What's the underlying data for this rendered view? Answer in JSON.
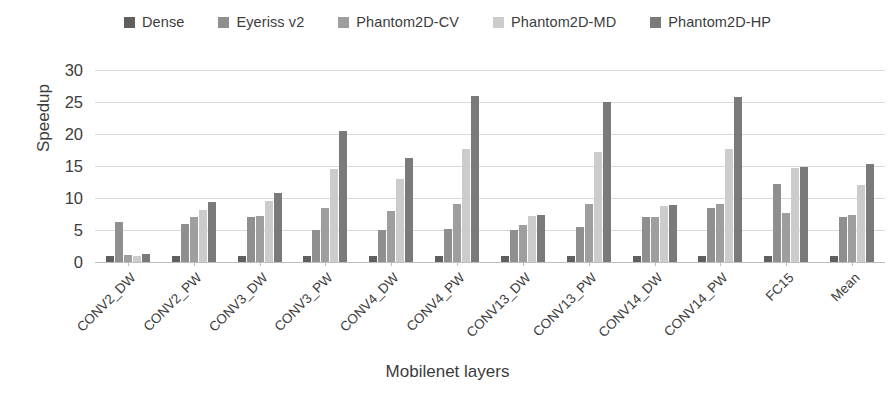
{
  "chart_data": {
    "type": "bar",
    "title": "",
    "xlabel": "Mobilenet layers",
    "ylabel": "Speedup",
    "ylim": [
      0,
      30
    ],
    "yticks": [
      0,
      5,
      10,
      15,
      20,
      25,
      30
    ],
    "ytick_labels": [
      "0",
      "5",
      "10",
      "15",
      "20",
      "25",
      "30"
    ],
    "grid": true,
    "legend_position": "top-center",
    "categories": [
      "CONV2_DW",
      "CONV2_PW",
      "CONV3_DW",
      "CONV3_PW",
      "CONV4_DW",
      "CONV4_PW",
      "CONV13_DW",
      "CONV13_PW",
      "CONV14_DW",
      "CONV14_PW",
      "FC15",
      "Mean"
    ],
    "series": [
      {
        "name": "Dense",
        "color": "#5f5f5f",
        "values": [
          1.0,
          1.0,
          1.0,
          1.0,
          1.0,
          1.0,
          1.0,
          1.0,
          1.0,
          1.0,
          1.0,
          1.0
        ]
      },
      {
        "name": "Eyeriss v2",
        "color": "#8f8f8f",
        "values": [
          6.3,
          6.0,
          7.0,
          5.0,
          5.0,
          5.1,
          5.0,
          5.5,
          7.1,
          8.5,
          12.2,
          7.0
        ]
      },
      {
        "name": "Phantom2D-CV",
        "color": "#9e9e9e",
        "values": [
          1.1,
          7.0,
          7.2,
          8.4,
          8.0,
          9.1,
          5.8,
          9.0,
          7.0,
          9.1,
          7.6,
          7.3
        ]
      },
      {
        "name": "Phantom2D-MD",
        "color": "#cccccc",
        "values": [
          1.0,
          8.2,
          9.5,
          14.5,
          13.0,
          17.7,
          7.2,
          17.2,
          8.8,
          17.7,
          14.7,
          12.0
        ]
      },
      {
        "name": "Phantom2D-HP",
        "color": "#7a7a7a",
        "values": [
          1.2,
          9.4,
          10.8,
          20.4,
          16.3,
          26.0,
          7.3,
          25.0,
          8.9,
          25.8,
          14.9,
          15.3
        ]
      }
    ]
  },
  "legend": {
    "items": [
      {
        "label": "Dense",
        "color": "#5f5f5f"
      },
      {
        "label": "Eyeriss v2",
        "color": "#8f8f8f"
      },
      {
        "label": "Phantom2D-CV",
        "color": "#9e9e9e"
      },
      {
        "label": "Phantom2D-MD",
        "color": "#cccccc"
      },
      {
        "label": "Phantom2D-HP",
        "color": "#7a7a7a"
      }
    ]
  },
  "axes": {
    "y_title": "Speedup",
    "x_title": "Mobilenet layers"
  }
}
